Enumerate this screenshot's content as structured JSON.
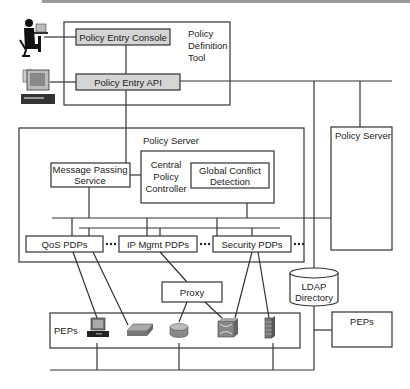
{
  "diagram": {
    "policy_definition_tool": {
      "label_lines": [
        "Policy",
        "Definition",
        "Tool"
      ],
      "console": "Policy Entry Console",
      "api": "Policy Entry API"
    },
    "policy_server_main": {
      "label": "Policy Server",
      "message_passing": [
        "Message Passing",
        "Service"
      ],
      "central_controller": [
        "Central",
        "Policy",
        "Controller"
      ],
      "global_conflict": [
        "Global Conflict",
        "Detection"
      ],
      "pdps": [
        "QoS PDPs",
        "IP Mgmt PDPs",
        "Security PDPs"
      ],
      "ellipsis": "•••"
    },
    "policy_server_right": {
      "label": "Policy Server"
    },
    "proxy": {
      "label": "Proxy"
    },
    "ldap": {
      "label_lines": [
        "LDAP",
        "Directory"
      ]
    },
    "peps_main": {
      "label": "PEPs",
      "devices": [
        "workstation-icon",
        "switch-icon",
        "router-icon",
        "atm-switch-icon",
        "firewall-icon"
      ]
    },
    "peps_right": {
      "label": "PEPs"
    },
    "actors": [
      "user-at-desk-icon",
      "computer-terminal-icon"
    ],
    "colors": {
      "line": "#333333",
      "box_fill_gray": "#d4d4d4",
      "device_gray": "#8a8a8a"
    }
  }
}
